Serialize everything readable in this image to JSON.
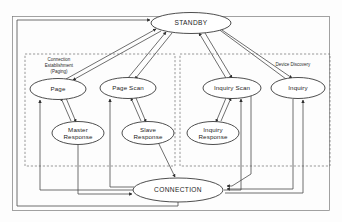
{
  "diagram": {
    "type": "state-diagram",
    "background_color": "#fdfdfd",
    "stroke_color": "#4a4a4a",
    "node_fill": "#ffffff",
    "groups": [
      {
        "id": "connection-establishment",
        "label_lines": [
          "Connection",
          "Establishment",
          "(Paging)"
        ],
        "style": "dashed",
        "x": 25,
        "y": 54,
        "width": 150,
        "height": 112
      },
      {
        "id": "device-discovery",
        "label_lines": [
          "Device Discovery"
        ],
        "style": "dashed",
        "x": 180,
        "y": 54,
        "width": 150,
        "height": 112
      }
    ],
    "nodes": [
      {
        "id": "standby",
        "label": "STANDBY",
        "label2": "",
        "cx": 191,
        "cy": 23,
        "rx": 40,
        "ry": 10.5,
        "emphasis": "big"
      },
      {
        "id": "page",
        "label": "Page",
        "label2": "",
        "cx": 58,
        "cy": 89,
        "rx": 28,
        "ry": 10.5,
        "emphasis": ""
      },
      {
        "id": "page-scan",
        "label": "Page Scan",
        "label2": "",
        "cx": 128,
        "cy": 88,
        "rx": 28,
        "ry": 10.5,
        "emphasis": ""
      },
      {
        "id": "inquiry-scan",
        "label": "Inquiry Scan",
        "label2": "",
        "cx": 232,
        "cy": 88,
        "rx": 29,
        "ry": 10.5,
        "emphasis": ""
      },
      {
        "id": "inquiry",
        "label": "Inquiry",
        "label2": "",
        "cx": 298,
        "cy": 88,
        "rx": 27,
        "ry": 10.5,
        "emphasis": ""
      },
      {
        "id": "master-response",
        "label": "Master",
        "label2": "Response",
        "cx": 78,
        "cy": 133,
        "rx": 26,
        "ry": 11.5,
        "emphasis": ""
      },
      {
        "id": "slave-response",
        "label": "Slave",
        "label2": "Response",
        "cx": 148,
        "cy": 133,
        "rx": 26,
        "ry": 11.5,
        "emphasis": ""
      },
      {
        "id": "inquiry-response",
        "label": "Inquiry",
        "label2": "Response",
        "cx": 213,
        "cy": 133,
        "rx": 26,
        "ry": 11.5,
        "emphasis": ""
      },
      {
        "id": "connection",
        "label": "CONNECTION",
        "label2": "",
        "cx": 178,
        "cy": 190,
        "rx": 45,
        "ry": 12,
        "emphasis": "big"
      }
    ],
    "edges": [
      {
        "id": "standby-to-page",
        "from": "standby",
        "to": "page"
      },
      {
        "id": "page-to-standby",
        "from": "page",
        "to": "standby"
      },
      {
        "id": "standby-to-page-scan",
        "from": "standby",
        "to": "page-scan"
      },
      {
        "id": "page-scan-to-standby",
        "from": "page-scan",
        "to": "standby"
      },
      {
        "id": "standby-to-inquiry-scan",
        "from": "standby",
        "to": "inquiry-scan"
      },
      {
        "id": "inquiry-scan-to-standby",
        "from": "inquiry-scan",
        "to": "standby"
      },
      {
        "id": "standby-to-inquiry",
        "from": "standby",
        "to": "inquiry"
      },
      {
        "id": "inquiry-to-standby",
        "from": "inquiry",
        "to": "standby"
      },
      {
        "id": "page-to-master-response",
        "from": "page",
        "to": "master-response"
      },
      {
        "id": "master-response-to-page",
        "from": "master-response",
        "to": "page"
      },
      {
        "id": "page-scan-to-slave-response",
        "from": "page-scan",
        "to": "slave-response"
      },
      {
        "id": "slave-response-to-page-scan",
        "from": "slave-response",
        "to": "page-scan"
      },
      {
        "id": "inquiry-scan-to-inquiry-response",
        "from": "inquiry-scan",
        "to": "inquiry-response"
      },
      {
        "id": "inquiry-response-to-inquiry-scan",
        "from": "inquiry-response",
        "to": "inquiry-scan"
      },
      {
        "id": "master-response-to-connection",
        "from": "master-response",
        "to": "connection"
      },
      {
        "id": "slave-response-to-connection",
        "from": "slave-response",
        "to": "connection"
      },
      {
        "id": "inquiry-scan-to-connection",
        "from": "inquiry-scan",
        "to": "connection"
      },
      {
        "id": "inquiry-to-connection",
        "from": "inquiry",
        "to": "connection"
      },
      {
        "id": "connection-to-page",
        "from": "connection",
        "to": "page"
      },
      {
        "id": "connection-to-page-scan",
        "from": "connection",
        "to": "page-scan"
      },
      {
        "id": "connection-to-inquiry-scan",
        "from": "connection",
        "to": "inquiry-scan"
      },
      {
        "id": "connection-to-inquiry",
        "from": "connection",
        "to": "inquiry"
      },
      {
        "id": "connection-to-standby",
        "from": "connection",
        "to": "standby"
      }
    ]
  }
}
